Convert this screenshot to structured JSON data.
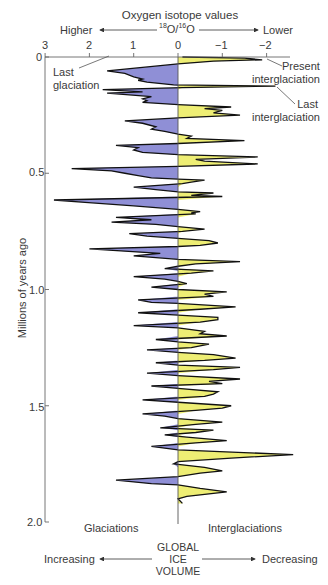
{
  "chart_data": {
    "type": "area",
    "orientation": "vertical",
    "title": "Oxygen isotope values",
    "subtitle": "18O/16O",
    "x_axis": {
      "label": "Oxygen isotope values 18O/16O",
      "ticks": [
        "3",
        "2",
        "1",
        "0",
        "−1",
        "−2"
      ],
      "tick_values": [
        3,
        2,
        1,
        0,
        -1,
        -2
      ],
      "direction_left": "Higher",
      "direction_right": "Lower",
      "range": [
        3,
        -2.3
      ]
    },
    "y_axis": {
      "label": "Millions of years ago",
      "ticks": [
        "0",
        "0.5",
        "1.0",
        "1.5",
        "2.0"
      ],
      "tick_values": [
        0,
        0.5,
        1.0,
        1.5,
        2.0
      ],
      "range": [
        0,
        2.0
      ],
      "inverted": true
    },
    "bottom_axis": {
      "label": "GLOBAL ICE VOLUME",
      "left": "Increasing",
      "right": "Decreasing"
    },
    "regions": {
      "left": "Glaciations",
      "right": "Interglaciations"
    },
    "colors": {
      "glaciation_fill": "#8f8fd6",
      "interglaciation_fill": "#eeee74",
      "outline": "#111111",
      "axis": "#777777"
    },
    "annotations": [
      {
        "text": "Present interglaciation",
        "age": 0.01,
        "value": -1.95
      },
      {
        "text": "Last interglaciation",
        "age": 0.125,
        "value": -2.2
      },
      {
        "text": "Last glaciation",
        "age": 0.065,
        "value": 1.6
      }
    ],
    "series": [
      {
        "name": "Oxygen isotope record (approx.)",
        "points": [
          [
            0.0,
            -0.1
          ],
          [
            0.005,
            -1.5
          ],
          [
            0.012,
            -1.9
          ],
          [
            0.018,
            -0.8
          ],
          [
            0.03,
            0.0
          ],
          [
            0.06,
            1.6
          ],
          [
            0.07,
            1.2
          ],
          [
            0.085,
            1.0
          ],
          [
            0.095,
            0.8
          ],
          [
            0.1,
            0.9
          ],
          [
            0.108,
            0.7
          ],
          [
            0.12,
            0.1
          ],
          [
            0.125,
            -2.2
          ],
          [
            0.132,
            -0.1
          ],
          [
            0.14,
            1.7
          ],
          [
            0.15,
            0.8
          ],
          [
            0.155,
            1.6
          ],
          [
            0.17,
            0.6
          ],
          [
            0.18,
            0.8
          ],
          [
            0.188,
            0.7
          ],
          [
            0.195,
            0.8
          ],
          [
            0.205,
            0.0
          ],
          [
            0.215,
            -1.2
          ],
          [
            0.222,
            -0.6
          ],
          [
            0.23,
            -1.0
          ],
          [
            0.24,
            -0.8
          ],
          [
            0.25,
            -1.4
          ],
          [
            0.262,
            0.0
          ],
          [
            0.275,
            1.2
          ],
          [
            0.285,
            0.8
          ],
          [
            0.3,
            0.5
          ],
          [
            0.31,
            0.6
          ],
          [
            0.32,
            0.3
          ],
          [
            0.332,
            0.0
          ],
          [
            0.34,
            -0.3
          ],
          [
            0.35,
            -0.2
          ],
          [
            0.36,
            -1.5
          ],
          [
            0.372,
            0.0
          ],
          [
            0.38,
            1.4
          ],
          [
            0.39,
            0.9
          ],
          [
            0.4,
            1.0
          ],
          [
            0.41,
            0.8
          ],
          [
            0.42,
            0.0
          ],
          [
            0.43,
            -1.8
          ],
          [
            0.44,
            -0.4
          ],
          [
            0.448,
            -0.6
          ],
          [
            0.46,
            -1.8
          ],
          [
            0.47,
            0.0
          ],
          [
            0.48,
            2.4
          ],
          [
            0.49,
            1.5
          ],
          [
            0.5,
            1.2
          ],
          [
            0.51,
            0.9
          ],
          [
            0.52,
            0.6
          ],
          [
            0.525,
            0.0
          ],
          [
            0.53,
            -0.6
          ],
          [
            0.538,
            -0.3
          ],
          [
            0.545,
            -0.1
          ],
          [
            0.56,
            1.0
          ],
          [
            0.57,
            0.5
          ],
          [
            0.58,
            0.0
          ],
          [
            0.585,
            -0.8
          ],
          [
            0.595,
            -0.3
          ],
          [
            0.6,
            -1.0
          ],
          [
            0.615,
            2.8
          ],
          [
            0.625,
            2.1
          ],
          [
            0.64,
            1.0
          ],
          [
            0.655,
            0.0
          ],
          [
            0.665,
            -0.5
          ],
          [
            0.67,
            -0.3
          ],
          [
            0.675,
            -0.4
          ],
          [
            0.69,
            1.4
          ],
          [
            0.7,
            0.6
          ],
          [
            0.71,
            1.5
          ],
          [
            0.72,
            0.5
          ],
          [
            0.73,
            0.0
          ],
          [
            0.74,
            -0.6
          ],
          [
            0.75,
            -0.1
          ],
          [
            0.76,
            1.1
          ],
          [
            0.77,
            0.7
          ],
          [
            0.78,
            0.0
          ],
          [
            0.79,
            -0.7
          ],
          [
            0.8,
            -0.9
          ],
          [
            0.81,
            -0.5
          ],
          [
            0.815,
            0.0
          ],
          [
            0.825,
            2.0
          ],
          [
            0.835,
            1.2
          ],
          [
            0.845,
            0.4
          ],
          [
            0.855,
            1.0
          ],
          [
            0.87,
            0.0
          ],
          [
            0.88,
            -1.4
          ],
          [
            0.89,
            -0.4
          ],
          [
            0.9,
            0.0
          ],
          [
            0.91,
            0.3
          ],
          [
            0.92,
            -0.8
          ],
          [
            0.93,
            -0.3
          ],
          [
            0.945,
            1.0
          ],
          [
            0.955,
            0.3
          ],
          [
            0.965,
            0.0
          ],
          [
            0.975,
            -0.2
          ],
          [
            0.99,
            0.6
          ],
          [
            1.0,
            0.0
          ],
          [
            1.01,
            -1.1
          ],
          [
            1.02,
            -0.6
          ],
          [
            1.03,
            -0.8
          ],
          [
            1.045,
            0.9
          ],
          [
            1.055,
            0.6
          ],
          [
            1.06,
            0.0
          ],
          [
            1.075,
            -1.3
          ],
          [
            1.085,
            -0.5
          ],
          [
            1.1,
            0.9
          ],
          [
            1.11,
            0.0
          ],
          [
            1.12,
            -0.9
          ],
          [
            1.13,
            -0.9
          ],
          [
            1.14,
            -0.5
          ],
          [
            1.155,
            1.0
          ],
          [
            1.165,
            0.0
          ],
          [
            1.18,
            -0.6
          ],
          [
            1.19,
            -0.5
          ],
          [
            1.2,
            -1.1
          ],
          [
            1.215,
            0.5
          ],
          [
            1.225,
            0.0
          ],
          [
            1.235,
            -0.7
          ],
          [
            1.25,
            -0.3
          ],
          [
            1.26,
            0.7
          ],
          [
            1.27,
            0.0
          ],
          [
            1.28,
            -0.8
          ],
          [
            1.295,
            -1.3
          ],
          [
            1.305,
            -0.6
          ],
          [
            1.315,
            0.5
          ],
          [
            1.325,
            0.0
          ],
          [
            1.335,
            -1.4
          ],
          [
            1.345,
            -0.8
          ],
          [
            1.36,
            0.7
          ],
          [
            1.37,
            0.0
          ],
          [
            1.385,
            -1.4
          ],
          [
            1.395,
            -0.7
          ],
          [
            1.405,
            -1.0
          ],
          [
            1.415,
            0.6
          ],
          [
            1.425,
            0.0
          ],
          [
            1.44,
            -0.9
          ],
          [
            1.45,
            -0.8
          ],
          [
            1.46,
            -0.6
          ],
          [
            1.475,
            0.8
          ],
          [
            1.485,
            0.0
          ],
          [
            1.5,
            -1.2
          ],
          [
            1.51,
            -1.0
          ],
          [
            1.52,
            -0.4
          ],
          [
            1.535,
            0.8
          ],
          [
            1.545,
            0.3
          ],
          [
            1.555,
            0.0
          ],
          [
            1.57,
            -1.0
          ],
          [
            1.58,
            -0.4
          ],
          [
            1.595,
            0.4
          ],
          [
            1.605,
            -0.8
          ],
          [
            1.615,
            -0.4
          ],
          [
            1.625,
            0.3
          ],
          [
            1.635,
            -0.2
          ],
          [
            1.65,
            -1.1
          ],
          [
            1.66,
            -0.4
          ],
          [
            1.675,
            0.6
          ],
          [
            1.69,
            0.0
          ],
          [
            1.71,
            -2.6
          ],
          [
            1.725,
            -1.2
          ],
          [
            1.74,
            0.0
          ],
          [
            1.75,
            0.1
          ],
          [
            1.765,
            -0.6
          ],
          [
            1.78,
            -1.0
          ],
          [
            1.79,
            -0.5
          ],
          [
            1.805,
            0.0
          ],
          [
            1.82,
            1.4
          ],
          [
            1.835,
            0.6
          ],
          [
            1.84,
            0.0
          ],
          [
            1.855,
            -0.5
          ],
          [
            1.87,
            -1.1
          ],
          [
            1.89,
            -0.2
          ],
          [
            1.9,
            0.0
          ],
          [
            1.92,
            -0.1
          ]
        ]
      }
    ]
  }
}
